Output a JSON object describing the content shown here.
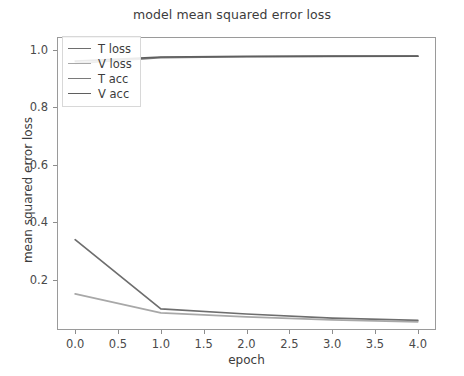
{
  "chart_data": {
    "type": "line",
    "title": "model mean squared error loss",
    "xlabel": "epoch",
    "ylabel": "mean squared error loss",
    "x": [
      0,
      1,
      2,
      3,
      4
    ],
    "xlim": [
      -0.2,
      4.2
    ],
    "ylim": [
      0.03,
      1.04
    ],
    "xticks": [
      0.0,
      0.5,
      1.0,
      1.5,
      2.0,
      2.5,
      3.0,
      3.5,
      4.0
    ],
    "xtick_labels": [
      "0.0",
      "0.5",
      "1.0",
      "1.5",
      "2.0",
      "2.5",
      "3.0",
      "3.5",
      "4.0"
    ],
    "yticks": [
      0.2,
      0.4,
      0.6,
      0.8,
      1.0
    ],
    "ytick_labels": [
      "0.2",
      "0.4",
      "0.6",
      "0.8",
      "1.0"
    ],
    "grid": false,
    "legend_position": "upper left",
    "series": [
      {
        "name": "T loss",
        "color": "#6e6e6e",
        "values": [
          0.34,
          0.1,
          0.082,
          0.068,
          0.06
        ]
      },
      {
        "name": "V loss",
        "color": "#a8a8a8",
        "values": [
          0.152,
          0.086,
          0.072,
          0.062,
          0.055
        ]
      },
      {
        "name": "T acc",
        "color": "#7a7a7a",
        "values": [
          0.952,
          0.972,
          0.975,
          0.976,
          0.977
        ]
      },
      {
        "name": "V acc",
        "color": "#5f5f5f",
        "values": [
          0.96,
          0.974,
          0.976,
          0.977,
          0.977
        ]
      }
    ]
  }
}
